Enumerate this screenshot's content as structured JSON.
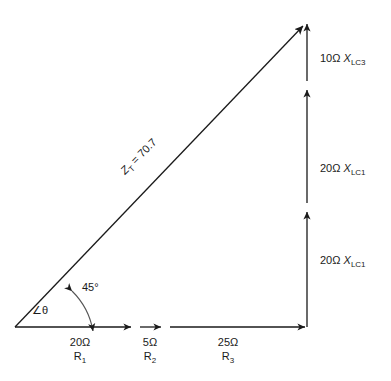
{
  "diagram": {
    "type": "impedance-phasor-triangle",
    "hypotenuse": {
      "label_prefix": "Z",
      "label_sub": "T",
      "label_value": " = 70.7"
    },
    "angle": {
      "theta_symbol": "∠θ",
      "value_label": "45°"
    },
    "horizontal_segments": [
      {
        "magnitude": "20Ω",
        "component_prefix": "R",
        "component_sub": "1"
      },
      {
        "magnitude": "5Ω",
        "component_prefix": "R",
        "component_sub": "2"
      },
      {
        "magnitude": "25Ω",
        "component_prefix": "R",
        "component_sub": "3"
      }
    ],
    "vertical_segments": [
      {
        "magnitude": "20Ω",
        "component_prefix": "X",
        "component_sub": "LC1"
      },
      {
        "magnitude": "20Ω",
        "component_prefix": "X",
        "component_sub": "LC1"
      },
      {
        "magnitude": "10Ω",
        "component_prefix": "X",
        "component_sub": "LC3"
      }
    ],
    "colors": {
      "stroke": "#1a1a1a",
      "background": "#ffffff"
    }
  }
}
